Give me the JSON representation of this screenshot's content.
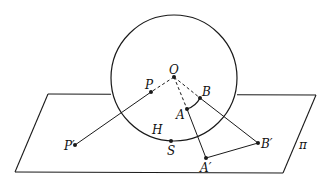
{
  "diagram": {
    "type": "stereographic-projection",
    "colors": {
      "stroke": "#1a1a1a",
      "background": "#ffffff"
    },
    "plane": {
      "label": "π",
      "corners": [
        [
          48,
          94
        ],
        [
          316,
          95
        ],
        [
          283,
          173
        ],
        [
          15,
          172
        ]
      ],
      "hidden_top_segment": [
        111,
        237
      ]
    },
    "sphere": {
      "center": [
        174,
        78
      ],
      "radius": 63
    },
    "points": [
      {
        "id": "O",
        "label": "O",
        "x": 174,
        "y": 77,
        "label_x": 169,
        "label_y": 74
      },
      {
        "id": "P",
        "label": "P",
        "x": 151,
        "y": 92,
        "label_x": 145,
        "label_y": 89
      },
      {
        "id": "B",
        "label": "B",
        "x": 200,
        "y": 98,
        "label_x": 202,
        "label_y": 96
      },
      {
        "id": "A",
        "label": "A",
        "x": 187,
        "y": 109,
        "label_x": 176,
        "label_y": 119
      },
      {
        "id": "P'",
        "label": "P′",
        "x": 75,
        "y": 145,
        "label_x": 64,
        "label_y": 150
      },
      {
        "id": "S",
        "label": "S",
        "x": 171,
        "y": 141,
        "label_x": 167,
        "label_y": 155
      },
      {
        "id": "B'",
        "label": "B′",
        "x": 258,
        "y": 143,
        "label_x": 261,
        "label_y": 148
      },
      {
        "id": "A'",
        "label": "A′",
        "x": 206,
        "y": 158,
        "label_x": 200,
        "label_y": 172
      }
    ],
    "extra_labels": [
      {
        "id": "H",
        "label": "H",
        "x": 152,
        "y": 134
      },
      {
        "id": "pi",
        "label": "π",
        "x": 299,
        "y": 149
      }
    ],
    "segments": [
      {
        "from": "O",
        "to": "P",
        "style": "dashed"
      },
      {
        "from": "P",
        "to": "P'",
        "style": "solid"
      },
      {
        "from": "O",
        "to": "B",
        "style": "dashed"
      },
      {
        "from": "B",
        "to": "B'",
        "style": "solid"
      },
      {
        "from": "O",
        "to": "A",
        "style": "dashed"
      },
      {
        "from": "A",
        "to": "A'",
        "style": "solid"
      },
      {
        "from": "A'",
        "to": "B'",
        "style": "solid"
      }
    ],
    "arc_AB": {
      "from": "A",
      "to": "B",
      "control": [
        196,
        106
      ]
    }
  }
}
